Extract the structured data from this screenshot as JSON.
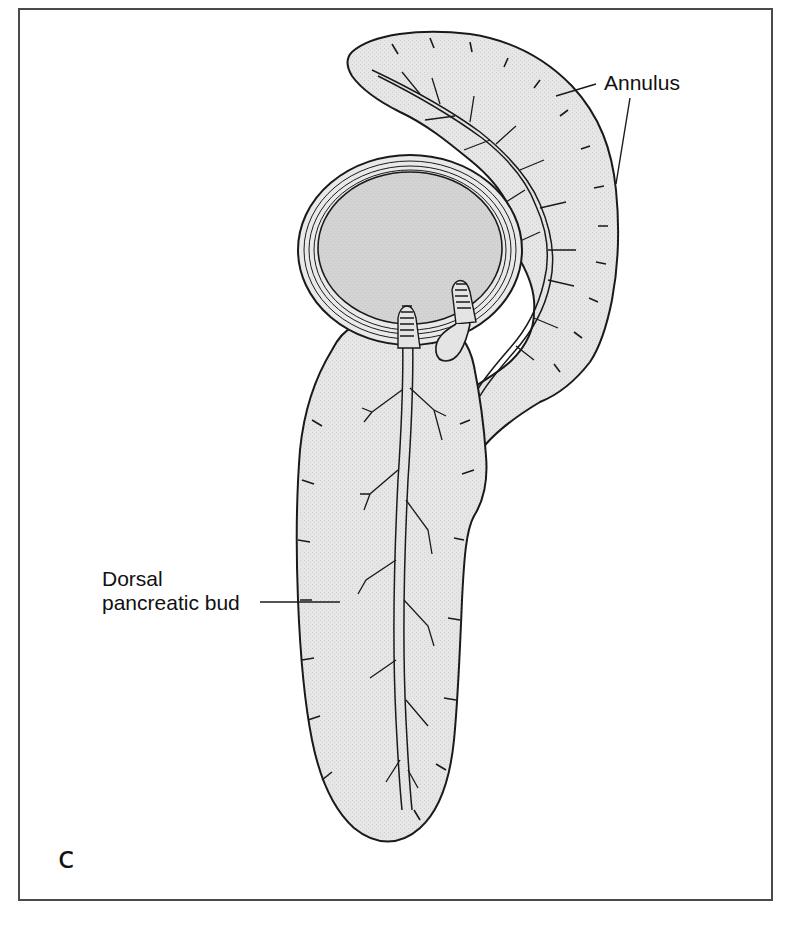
{
  "figure": {
    "panel_letter": "c",
    "labels": {
      "annulus": "Annulus",
      "dorsal_bud_line1": "Dorsal",
      "dorsal_bud_line2": "pancreatic bud"
    },
    "structures": [
      "duodenum-cross-section",
      "annular-pancreas-ring",
      "dorsal-pancreatic-bud",
      "pancreatic-duct-system",
      "duct-openings-papillae"
    ],
    "colors": {
      "tissue_fill": "#e4e4e4",
      "duodenum_lumen": "#d2d2d2",
      "outline": "#1a1a1a",
      "frame": "#4a4a4a",
      "background": "#ffffff"
    }
  }
}
